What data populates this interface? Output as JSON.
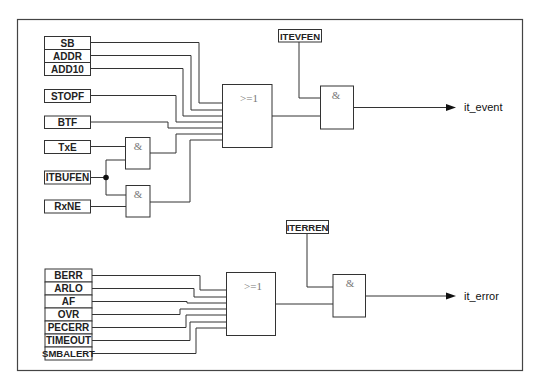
{
  "diagram": {
    "colors": {
      "line": "#333333",
      "gate_text": "#777777",
      "frame": "#444444"
    },
    "event_group": {
      "inputs": [
        "SB",
        "ADDR",
        "ADD10",
        "STOPF",
        "BTF",
        "TxE",
        "ITBUFEN",
        "RxNE"
      ],
      "and_gates": [
        {
          "symbol": "&",
          "inputs": [
            "TxE",
            "ITBUFEN"
          ]
        },
        {
          "symbol": "&",
          "inputs": [
            "ITBUFEN",
            "RxNE"
          ]
        }
      ],
      "or_gate": {
        "symbol": ">=1"
      },
      "enable": "ITEVFEN",
      "final_and": {
        "symbol": "&"
      },
      "output": "it_event"
    },
    "error_group": {
      "inputs": [
        "BERR",
        "ARLO",
        "AF",
        "OVR",
        "PECERR",
        "TIMEOUT",
        "SMBALERT"
      ],
      "or_gate": {
        "symbol": ">=1"
      },
      "enable": "ITERREN",
      "final_and": {
        "symbol": "&"
      },
      "output": "it_error"
    }
  }
}
